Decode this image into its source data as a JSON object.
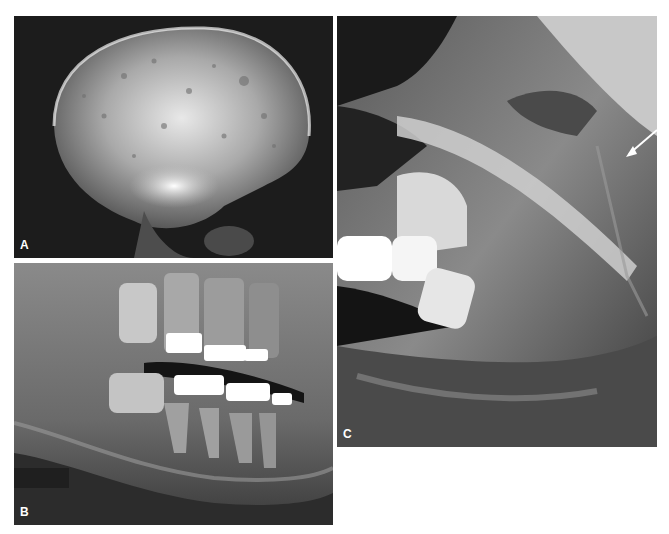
{
  "figure": {
    "panels": [
      {
        "id": "A",
        "label": "A",
        "description": "Lateral skull radiograph with mottled radiolucencies"
      },
      {
        "id": "B",
        "label": "B",
        "description": "Panoramic radiograph of posterior mandible and maxilla with metallic restorations"
      },
      {
        "id": "C",
        "label": "C",
        "description": "Lateral oblique jaw radiograph with arrow annotation"
      }
    ],
    "annotations": [
      {
        "panel": "C",
        "type": "arrow",
        "color": "#ffffff"
      }
    ]
  }
}
